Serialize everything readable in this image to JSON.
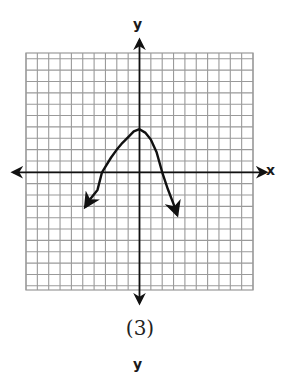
{
  "figure": {
    "caption": "(3)",
    "next_figure_label": "y"
  },
  "chart_data": {
    "type": "line",
    "title": "",
    "xlabel": "x",
    "ylabel": "y",
    "xlim": [
      -10,
      10
    ],
    "ylim": [
      -10,
      10
    ],
    "grid": true,
    "grid_spacing": 1,
    "tick_labels": "none",
    "axes_arrows": true,
    "series": [
      {
        "name": "curve",
        "description": "Peaked curve with vertex near (0,4); both ends continue downward with arrows",
        "x": [
          -4.75,
          -4.3,
          -3.7,
          -3.3,
          -3,
          -2.5,
          -2,
          -1.5,
          -1,
          -0.5,
          0,
          0.5,
          1,
          1.5,
          2,
          2.5,
          3,
          3.3
        ],
        "y": [
          -3.0,
          -2.3,
          -1.55,
          -0.0,
          0.5,
          1.3,
          2.0,
          2.6,
          3.1,
          3.6,
          3.8,
          3.5,
          2.9,
          1.8,
          0.0,
          -1.5,
          -2.8,
          -3.7
        ]
      }
    ],
    "key_points": {
      "vertex": [
        0,
        4
      ],
      "x_intercepts": [
        -3.3,
        2
      ],
      "y_intercept": 4,
      "left_arrow_end": [
        -4.75,
        -3.0
      ],
      "right_arrow_end": [
        3.3,
        -3.7
      ]
    },
    "colors": {
      "grid": "#9a9a9a",
      "axes": "#111111",
      "curve": "#111111"
    }
  }
}
